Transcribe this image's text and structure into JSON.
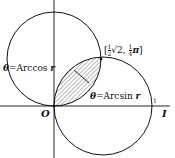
{
  "diagram": {
    "labels": {
      "arccos": {
        "theta": "θ",
        "eq": "=",
        "fn": "Arccos",
        "var": "r"
      },
      "arcsin": {
        "theta": "θ",
        "eq": "=",
        "fn": "Arcsin",
        "var": "r"
      },
      "point": {
        "open": "[",
        "frac1_num": "1",
        "frac1_den": "2",
        "sqrt": "√2,",
        "frac2_num": "1",
        "frac2_den": "4",
        "pi": "π",
        "close": "]"
      },
      "origin": "O",
      "unit_mark": "1",
      "axis_end": "I"
    },
    "colors": {
      "stroke": "#111111",
      "hatch": "#333333",
      "background": "#ffffff"
    }
  }
}
